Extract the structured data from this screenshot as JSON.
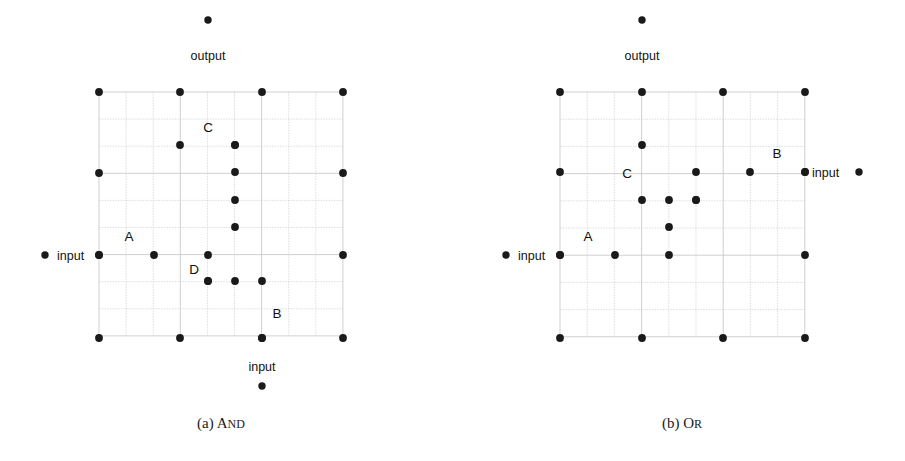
{
  "figure": {
    "width": 905,
    "height": 461,
    "background": "#ffffff",
    "grid_line_color": "#c9c9c9",
    "dot_color": "#1a1a1a",
    "segment_color": "#8a8a8a",
    "segment_edge_color": "#555555",
    "text_color": "#111111"
  },
  "panels": [
    {
      "id": "and",
      "caption_prefix": "(a)",
      "caption_name": "And",
      "caption_first": "A",
      "caption_rest": "ND",
      "grid": {
        "x0": 99,
        "y0": 92,
        "cell": 27.1,
        "cols": 9,
        "rows": 9
      },
      "caption": {
        "x": 221,
        "y": 428
      },
      "terminals": [
        {
          "name": "output-terminal",
          "label": "output",
          "dot_x": 208,
          "dot_y": 20,
          "label_x": 208,
          "label_y": 60,
          "label_anchor": "middle"
        },
        {
          "name": "input-left-terminal",
          "label": "input",
          "dot_x": 45,
          "dot_y": 255,
          "label_x": 57,
          "label_y": 260,
          "label_anchor": "start"
        },
        {
          "name": "input-bottom-terminal",
          "label": "input",
          "dot_x": 262,
          "dot_y": 386,
          "label_x": 262,
          "label_y": 371,
          "label_anchor": "middle"
        }
      ],
      "boundary_dots": [
        {
          "cx": 99,
          "cy": 92
        },
        {
          "cx": 180,
          "cy": 92
        },
        {
          "cx": 262,
          "cy": 92
        },
        {
          "cx": 343,
          "cy": 92
        },
        {
          "cx": 99,
          "cy": 173
        },
        {
          "cx": 343,
          "cy": 173
        },
        {
          "cx": 99,
          "cy": 255
        },
        {
          "cx": 343,
          "cy": 255
        },
        {
          "cx": 99,
          "cy": 338
        },
        {
          "cx": 180,
          "cy": 338
        },
        {
          "cx": 262,
          "cy": 338
        },
        {
          "cx": 343,
          "cy": 338
        }
      ],
      "interior_dots": [
        {
          "cx": 235,
          "cy": 145
        },
        {
          "cx": 235,
          "cy": 172
        },
        {
          "cx": 235,
          "cy": 200
        },
        {
          "cx": 235,
          "cy": 227
        },
        {
          "cx": 235,
          "cy": 281
        },
        {
          "cx": 208,
          "cy": 281
        }
      ],
      "segments": [
        {
          "name": "segment-c",
          "label": "C",
          "x1": 180,
          "y1": 145,
          "x2": 235,
          "y2": 145,
          "label_x": 208,
          "label_y": 132
        },
        {
          "name": "segment-a",
          "label": "A",
          "x1": 99,
          "y1": 255,
          "x2": 154,
          "y2": 255,
          "label_x": 129,
          "label_y": 241
        },
        {
          "name": "segment-d",
          "label": "D",
          "x1": 208,
          "y1": 255,
          "x2": 208,
          "y2": 281,
          "label_x": 194,
          "label_y": 274
        },
        {
          "name": "segment-b",
          "label": "B",
          "x1": 262,
          "y1": 281,
          "x2": 262,
          "y2": 338,
          "label_x": 277,
          "label_y": 318
        }
      ]
    },
    {
      "id": "or",
      "caption_prefix": "(b)",
      "caption_name": "Or",
      "caption_first": "O",
      "caption_rest": "R",
      "grid": {
        "x0": 560,
        "y0": 92,
        "cell": 27.2,
        "cols": 9,
        "rows": 9
      },
      "caption": {
        "x": 682,
        "y": 428
      },
      "terminals": [
        {
          "name": "output-terminal",
          "label": "output",
          "dot_x": 642,
          "dot_y": 20,
          "label_x": 642,
          "label_y": 60,
          "label_anchor": "middle"
        },
        {
          "name": "input-left-terminal",
          "label": "input",
          "dot_x": 506,
          "dot_y": 255,
          "label_x": 518,
          "label_y": 260,
          "label_anchor": "start"
        },
        {
          "name": "input-right-terminal",
          "label": "input",
          "dot_x": 859,
          "dot_y": 172,
          "label_x": 812,
          "label_y": 177,
          "label_anchor": "start"
        }
      ],
      "boundary_dots": [
        {
          "cx": 560,
          "cy": 92
        },
        {
          "cx": 642,
          "cy": 92
        },
        {
          "cx": 723,
          "cy": 92
        },
        {
          "cx": 805,
          "cy": 92
        },
        {
          "cx": 560,
          "cy": 172
        },
        {
          "cx": 805,
          "cy": 172
        },
        {
          "cx": 560,
          "cy": 255
        },
        {
          "cx": 805,
          "cy": 255
        },
        {
          "cx": 560,
          "cy": 338
        },
        {
          "cx": 642,
          "cy": 338
        },
        {
          "cx": 723,
          "cy": 338
        },
        {
          "cx": 805,
          "cy": 338
        }
      ],
      "interior_dots": [
        {
          "cx": 669,
          "cy": 200
        },
        {
          "cx": 696,
          "cy": 200
        }
      ],
      "segments": [
        {
          "name": "segment-c",
          "label": "C",
          "x1": 642,
          "y1": 145,
          "x2": 642,
          "y2": 200,
          "label_x": 627,
          "label_y": 178
        },
        {
          "name": "segment-b",
          "label": "B",
          "x1": 750,
          "y1": 172,
          "x2": 805,
          "y2": 172,
          "label_x": 777,
          "label_y": 158
        },
        {
          "name": "segment-right-stub",
          "label": "",
          "x1": 696,
          "y1": 172,
          "x2": 696,
          "y2": 200,
          "label_x": 0,
          "label_y": 0
        },
        {
          "name": "segment-mid-stub",
          "label": "",
          "x1": 669,
          "y1": 227,
          "x2": 669,
          "y2": 255,
          "label_x": 0,
          "label_y": 0
        },
        {
          "name": "segment-a",
          "label": "A",
          "x1": 560,
          "y1": 255,
          "x2": 615,
          "y2": 255,
          "label_x": 588,
          "label_y": 241
        }
      ]
    }
  ]
}
